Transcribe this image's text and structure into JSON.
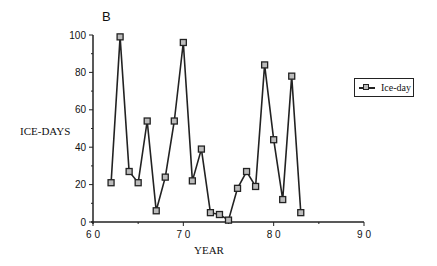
{
  "chart_data": {
    "type": "line",
    "title": "B",
    "xlabel": "YEAR",
    "ylabel": "ICE-DAYS",
    "xlim": [
      60,
      90
    ],
    "ylim": [
      0,
      100
    ],
    "x_ticks": [
      60,
      70,
      80,
      90
    ],
    "x_tick_labels": [
      "6 0",
      "7 0",
      "8 0",
      "9 0"
    ],
    "y_ticks": [
      0,
      20,
      40,
      60,
      80,
      100
    ],
    "grid": false,
    "legend_position": "right",
    "series": [
      {
        "name": "Ice-day",
        "marker": "square",
        "x": [
          62,
          63,
          64,
          65,
          66,
          67,
          68,
          69,
          70,
          71,
          72,
          73,
          74,
          75,
          76,
          77,
          78,
          79,
          80,
          81,
          82,
          83
        ],
        "values": [
          21,
          99,
          27,
          21,
          54,
          6,
          24,
          54,
          96,
          22,
          39,
          5,
          4,
          1,
          18,
          27,
          19,
          84,
          44,
          12,
          78,
          5
        ]
      }
    ]
  },
  "panel_label": "B",
  "axis": {
    "xlabel": "YEAR",
    "ylabel": "ICE-DAYS"
  },
  "legend": {
    "label": "Ice-day"
  },
  "colors": {
    "line": "#222222",
    "marker_fill": "#bbbbbb",
    "axis": "#222222"
  }
}
